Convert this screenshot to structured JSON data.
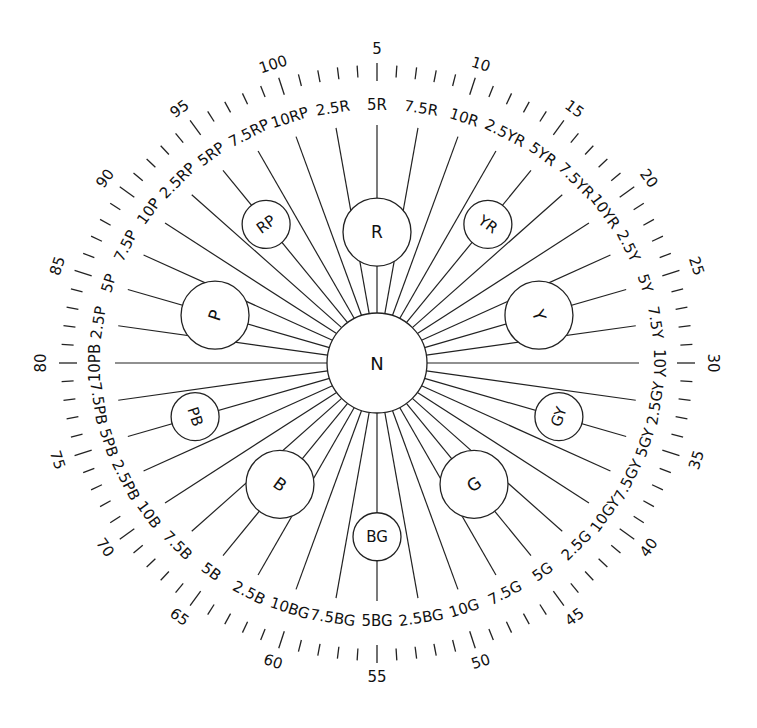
{
  "diagram": {
    "center": {
      "label": "N",
      "cx": 377,
      "cy": 363,
      "r": 50
    },
    "geometry": {
      "spoke_rx": 262,
      "spoke_ry": 238,
      "tick_rx": 310,
      "tick_ry": 292,
      "num_rx": 336,
      "num_ry": 314,
      "hue_label_rx": 282,
      "hue_label_ry": 258
    },
    "principal_hues": [
      {
        "label": "R",
        "step": 5,
        "dist": 0.55,
        "r": 34
      },
      {
        "label": "YR",
        "step": 15,
        "dist": 0.72,
        "r": 24
      },
      {
        "label": "Y",
        "step": 25,
        "dist": 0.65,
        "r": 34
      },
      {
        "label": "GY",
        "step": 35,
        "dist": 0.73,
        "r": 24
      },
      {
        "label": "G",
        "step": 45,
        "dist": 0.63,
        "r": 34
      },
      {
        "label": "BG",
        "step": 55,
        "dist": 0.73,
        "r": 24
      },
      {
        "label": "B",
        "step": 65,
        "dist": 0.63,
        "r": 34
      },
      {
        "label": "PB",
        "step": 75,
        "dist": 0.73,
        "r": 24
      },
      {
        "label": "P",
        "step": 85,
        "dist": 0.65,
        "r": 34
      },
      {
        "label": "RP",
        "step": 95,
        "dist": 0.72,
        "r": 24
      }
    ],
    "hue_labels": [
      {
        "step": 2.5,
        "label": "2.5R"
      },
      {
        "step": 5,
        "label": "5R"
      },
      {
        "step": 7.5,
        "label": "7.5R"
      },
      {
        "step": 10,
        "label": "10R"
      },
      {
        "step": 12.5,
        "label": "2.5YR"
      },
      {
        "step": 15,
        "label": "5YR"
      },
      {
        "step": 17.5,
        "label": "7.5YR"
      },
      {
        "step": 20,
        "label": "10YR"
      },
      {
        "step": 22.5,
        "label": "2.5Y"
      },
      {
        "step": 25,
        "label": "5Y"
      },
      {
        "step": 27.5,
        "label": "7.5Y"
      },
      {
        "step": 30,
        "label": "10Y"
      },
      {
        "step": 32.5,
        "label": "2.5GY"
      },
      {
        "step": 35,
        "label": "5GY"
      },
      {
        "step": 37.5,
        "label": "7.5GY"
      },
      {
        "step": 40,
        "label": "10GY"
      },
      {
        "step": 42.5,
        "label": "2.5G"
      },
      {
        "step": 45,
        "label": "5G"
      },
      {
        "step": 47.5,
        "label": "7.5G"
      },
      {
        "step": 50,
        "label": "10G"
      },
      {
        "step": 52.5,
        "label": "2.5BG"
      },
      {
        "step": 55,
        "label": "5BG"
      },
      {
        "step": 57.5,
        "label": "7.5BG"
      },
      {
        "step": 60,
        "label": "10BG"
      },
      {
        "step": 62.5,
        "label": "2.5B"
      },
      {
        "step": 65,
        "label": "5B"
      },
      {
        "step": 67.5,
        "label": "7.5B"
      },
      {
        "step": 70,
        "label": "10B"
      },
      {
        "step": 72.5,
        "label": "2.5PB"
      },
      {
        "step": 75,
        "label": "5PB"
      },
      {
        "step": 77.5,
        "label": "7.5PB"
      },
      {
        "step": 80,
        "label": "10PB"
      },
      {
        "step": 82.5,
        "label": "2.5P"
      },
      {
        "step": 85,
        "label": "5P"
      },
      {
        "step": 87.5,
        "label": "7.5P"
      },
      {
        "step": 90,
        "label": "10P"
      },
      {
        "step": 92.5,
        "label": "2.5RP"
      },
      {
        "step": 95,
        "label": "5RP"
      },
      {
        "step": 97.5,
        "label": "7.5RP"
      },
      {
        "step": 100,
        "label": "10RP"
      }
    ],
    "scale_numbers": [
      "5",
      "10",
      "15",
      "20",
      "25",
      "30",
      "35",
      "40",
      "45",
      "50",
      "55",
      "60",
      "65",
      "70",
      "75",
      "80",
      "85",
      "90",
      "95",
      "100"
    ],
    "tick_count": 100
  }
}
